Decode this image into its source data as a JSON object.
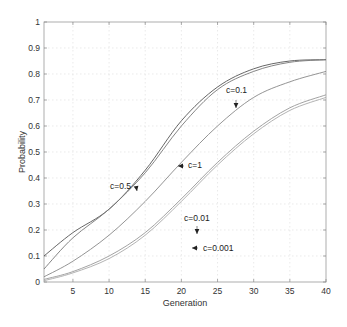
{
  "chart_data": {
    "type": "line",
    "title": "",
    "xlabel": "Generation",
    "ylabel": "Probability",
    "xlim": [
      1,
      40
    ],
    "ylim": [
      0,
      1
    ],
    "grid": true,
    "legend": "none (inline annotations with arrows)",
    "xticks": [
      5,
      10,
      15,
      20,
      25,
      30,
      35,
      40
    ],
    "yticks": [
      0,
      0.1,
      0.2,
      0.3,
      0.4,
      0.5,
      0.6,
      0.7,
      0.8,
      0.9,
      1
    ],
    "xtick_labels": [
      "5",
      "10",
      "15",
      "20",
      "25",
      "30",
      "35",
      "40"
    ],
    "ytick_labels": [
      "0",
      "0.1",
      "0.2",
      "0.3",
      "0.4",
      "0.5",
      "0.6",
      "0.7",
      "0.8",
      "0.9",
      "1"
    ],
    "x": [
      1,
      5,
      10,
      15,
      20,
      25,
      30,
      35,
      40
    ],
    "series": [
      {
        "name": "c=0.5",
        "values": [
          0.1,
          0.19,
          0.28,
          0.43,
          0.62,
          0.75,
          0.82,
          0.85,
          0.855
        ],
        "color": "#555555"
      },
      {
        "name": "c=1",
        "values": [
          0.05,
          0.17,
          0.28,
          0.42,
          0.6,
          0.74,
          0.81,
          0.845,
          0.855
        ],
        "color": "#777777"
      },
      {
        "name": "c=0.1",
        "values": [
          0.02,
          0.08,
          0.18,
          0.31,
          0.46,
          0.6,
          0.71,
          0.77,
          0.81
        ],
        "color": "#888888"
      },
      {
        "name": "c=0.01",
        "values": [
          0.01,
          0.04,
          0.1,
          0.19,
          0.32,
          0.46,
          0.58,
          0.67,
          0.72
        ],
        "color": "#999999"
      },
      {
        "name": "c=0.001",
        "values": [
          0.005,
          0.035,
          0.09,
          0.18,
          0.31,
          0.45,
          0.57,
          0.66,
          0.71
        ],
        "color": "#aaaaaa"
      }
    ],
    "annotations": [
      {
        "text": "c=0.5",
        "label_x": 110,
        "label_y": 189,
        "arrow_to": [
          137,
          191
        ]
      },
      {
        "text": "c=1",
        "label_x": 188,
        "label_y": 168,
        "arrow_to": [
          178,
          166
        ]
      },
      {
        "text": "c=0.1",
        "label_x": 226,
        "label_y": 93,
        "arrow_to": [
          236,
          108
        ]
      },
      {
        "text": "c=0.01",
        "label_x": 184,
        "label_y": 221,
        "arrow_to": [
          197,
          234
        ]
      },
      {
        "text": "c=0.001",
        "label_x": 203,
        "label_y": 251,
        "arrow_to": [
          192,
          248
        ]
      }
    ]
  }
}
